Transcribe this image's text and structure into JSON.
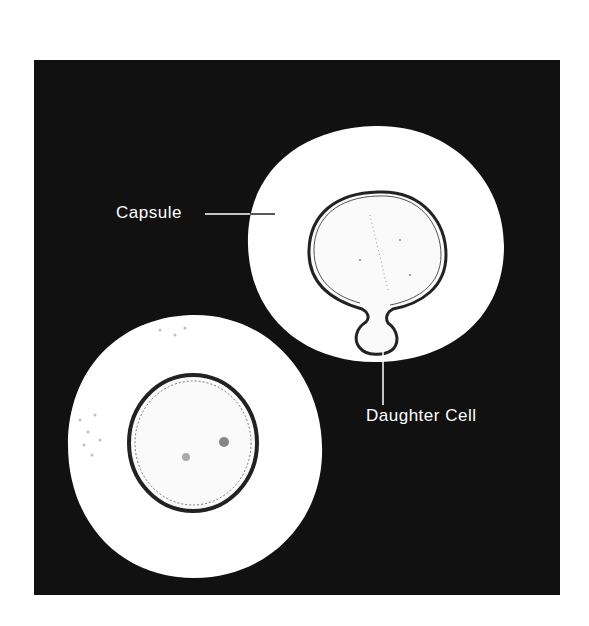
{
  "figure": {
    "background_color": "#111111",
    "capsule_color": "#ffffff",
    "cell_wall_color": "#222222",
    "labels": {
      "capsule": "Capsule",
      "daughter_cell": "Daughter Cell"
    },
    "elements": [
      {
        "name": "budding-cell",
        "description": "Cell with daughter cell bud surrounded by capsule (upper right)"
      },
      {
        "name": "single-cell",
        "description": "Encapsulated single cell (lower left)"
      }
    ]
  }
}
